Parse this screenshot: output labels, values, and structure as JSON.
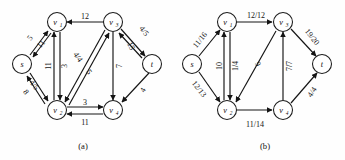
{
  "figure": {
    "panels": [
      {
        "id": "a",
        "caption": "(a)",
        "nodes": [
          {
            "id": "s",
            "label": "s",
            "sub": "",
            "cx": 22,
            "cy": 64
          },
          {
            "id": "v1",
            "label": "v",
            "sub": "1",
            "cx": 57,
            "cy": 22
          },
          {
            "id": "v2",
            "label": "v",
            "sub": "2",
            "cx": 57,
            "cy": 110
          },
          {
            "id": "v3",
            "label": "v",
            "sub": "3",
            "cx": 113,
            "cy": 22
          },
          {
            "id": "v4",
            "label": "v",
            "sub": "4",
            "cx": 113,
            "cy": 110
          },
          {
            "id": "t",
            "label": "t",
            "sub": "",
            "cx": 152,
            "cy": 64
          }
        ],
        "edges": [
          {
            "from": "s",
            "to": "v1",
            "label": "5",
            "lx": 30,
            "ly": 38,
            "rot": -52
          },
          {
            "from": "v1",
            "to": "s",
            "label": "11",
            "lx": 41,
            "ly": 44,
            "rot": -52
          },
          {
            "from": "s",
            "to": "v2",
            "label": "4/5",
            "lx": 34,
            "ly": 85,
            "rot": 52
          },
          {
            "from": "v2",
            "to": "s",
            "label": "8",
            "lx": 26,
            "ly": 92,
            "rot": 52
          },
          {
            "from": "v2",
            "to": "v1",
            "label": "11",
            "lx": 48,
            "ly": 66,
            "rot": -90
          },
          {
            "from": "v1",
            "to": "v2",
            "label": "3",
            "lx": 62,
            "ly": 66,
            "rot": -90
          },
          {
            "from": "v3",
            "to": "v1",
            "label": "12",
            "lx": 85,
            "ly": 16,
            "rot": 0
          },
          {
            "from": "v3",
            "to": "v2",
            "label": "4/4",
            "lx": 78,
            "ly": 57,
            "rot": 56
          },
          {
            "from": "v2",
            "to": "v3",
            "label": "5",
            "lx": 87,
            "ly": 70,
            "rot": 56
          },
          {
            "from": "v3",
            "to": "v4",
            "label": "7",
            "lx": 118,
            "ly": 66,
            "rot": -90
          },
          {
            "from": "v3",
            "to": "t",
            "label": "4/5",
            "lx": 143,
            "ly": 32,
            "rot": 52
          },
          {
            "from": "t",
            "to": "v3",
            "label": "15",
            "lx": 131,
            "ly": 45,
            "rot": 64
          },
          {
            "from": "t",
            "to": "v4",
            "label": "4",
            "lx": 142,
            "ly": 90,
            "rot": -62
          },
          {
            "from": "v2",
            "to": "v4",
            "label": "3",
            "lx": 85,
            "ly": 103,
            "rot": 0
          },
          {
            "from": "v4",
            "to": "v2",
            "label": "11",
            "lx": 85,
            "ly": 121,
            "rot": 0
          }
        ]
      },
      {
        "id": "b",
        "caption": "(b)",
        "nodes": [
          {
            "id": "s",
            "label": "s",
            "sub": "",
            "cx": 192,
            "cy": 64
          },
          {
            "id": "v1",
            "label": "v",
            "sub": "1",
            "cx": 227,
            "cy": 22
          },
          {
            "id": "v2",
            "label": "v",
            "sub": "2",
            "cx": 227,
            "cy": 110
          },
          {
            "id": "v3",
            "label": "v",
            "sub": "3",
            "cx": 283,
            "cy": 22
          },
          {
            "id": "v4",
            "label": "v",
            "sub": "4",
            "cx": 283,
            "cy": 110
          },
          {
            "id": "t",
            "label": "t",
            "sub": "",
            "cx": 322,
            "cy": 64
          }
        ],
        "edges": [
          {
            "from": "s",
            "to": "v1",
            "label": "11/16",
            "lx": 200,
            "ly": 40,
            "rot": -52
          },
          {
            "from": "s",
            "to": "v2",
            "label": "12/13",
            "lx": 200,
            "ly": 88,
            "rot": 52
          },
          {
            "from": "v2",
            "to": "v1",
            "label": "10",
            "lx": 219,
            "ly": 66,
            "rot": -90
          },
          {
            "from": "v1",
            "to": "v2",
            "label": "1/4",
            "lx": 233,
            "ly": 66,
            "rot": -90
          },
          {
            "from": "v1",
            "to": "v3",
            "label": "12/12",
            "lx": 255,
            "ly": 15,
            "rot": 0
          },
          {
            "from": "v3",
            "to": "v2",
            "label": "9",
            "lx": 256,
            "ly": 64,
            "rot": 56
          },
          {
            "from": "v4",
            "to": "v3",
            "label": "7/7",
            "lx": 288,
            "ly": 66,
            "rot": -90
          },
          {
            "from": "v3",
            "to": "t",
            "label": "19/20",
            "lx": 311,
            "ly": 37,
            "rot": 52
          },
          {
            "from": "v4",
            "to": "t",
            "label": "4/4",
            "lx": 311,
            "ly": 92,
            "rot": -56
          },
          {
            "from": "v2",
            "to": "v4",
            "label": "11/14",
            "lx": 255,
            "ly": 123,
            "rot": 0
          }
        ]
      }
    ]
  }
}
